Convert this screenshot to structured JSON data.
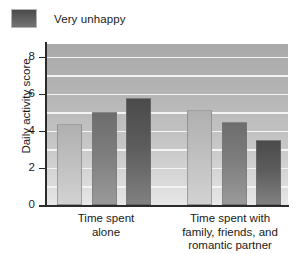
{
  "legend": {
    "items": [
      {
        "label": "Very unhappy",
        "swatch_color": "#5e5e5e"
      }
    ]
  },
  "chart_data": {
    "type": "bar",
    "title": "",
    "xlabel": "",
    "ylabel": "Daily activity score",
    "ylim": [
      0,
      8.7
    ],
    "yticks": [
      "0",
      "2",
      "4",
      "6",
      "8"
    ],
    "ytick_values": [
      0,
      2,
      4,
      6,
      8
    ],
    "grid": true,
    "grid_interval": 1,
    "legend_position": "top-left",
    "categories": [
      "Time spent alone",
      "Time spent with family, friends, and romantic partner"
    ],
    "category_lines": [
      [
        "Time spent",
        "alone"
      ],
      [
        "Time spent with",
        "family, friends, and",
        "romantic partner"
      ]
    ],
    "series": [
      {
        "name": "series-1",
        "color": "#bdbdbd",
        "values": [
          4.4,
          5.15
        ]
      },
      {
        "name": "series-2",
        "color": "#7d7d7d",
        "values": [
          5.0,
          4.5
        ]
      },
      {
        "name": "series-3",
        "color": "#5c5c5c",
        "values": [
          5.8,
          3.5
        ]
      }
    ],
    "bars": [
      {
        "group": 0,
        "series": 0,
        "value": 4.4
      },
      {
        "group": 0,
        "series": 1,
        "value": 5.0
      },
      {
        "group": 0,
        "series": 2,
        "value": 5.8
      },
      {
        "group": 1,
        "series": 0,
        "value": 5.15
      },
      {
        "group": 1,
        "series": 1,
        "value": 4.5
      },
      {
        "group": 1,
        "series": 2,
        "value": 3.5
      }
    ]
  }
}
